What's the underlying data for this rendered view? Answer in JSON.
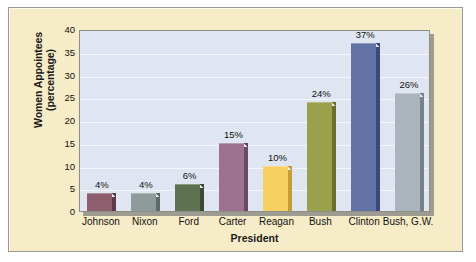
{
  "chart_data": {
    "type": "bar",
    "title": "",
    "xlabel": "President",
    "ylabel": "Women Appointees (percentage)",
    "ylabel_line1": "Women Appointees",
    "ylabel_line2": "(percentage)",
    "categories": [
      "Johnson",
      "Nixon",
      "Ford",
      "Carter",
      "Reagan",
      "Bush",
      "Clinton",
      "Bush, G.W."
    ],
    "values": [
      4,
      4,
      6,
      15,
      10,
      24,
      37,
      26
    ],
    "value_labels": [
      "4%",
      "4%",
      "6%",
      "15%",
      "10%",
      "24%",
      "37%",
      "26%"
    ],
    "ylim": [
      0,
      40
    ],
    "yticks": [
      40,
      35,
      30,
      25,
      20,
      15,
      10,
      5,
      0
    ],
    "ytick_labels": [
      "40",
      "35",
      "30",
      "25",
      "20",
      "15",
      "10",
      "5",
      "0"
    ],
    "grid": true,
    "legend": "none",
    "bar_colors": [
      "#8d5f6e",
      "#8d9b9a",
      "#5e7150",
      "#9d7190",
      "#f6d063",
      "#9aa04b",
      "#6373a8",
      "#a9b4bd"
    ],
    "bar_side_colors": [
      "#5d3c48",
      "#5e6a69",
      "#3c4a33",
      "#6a4a61",
      "#c49e34",
      "#6a6e2f",
      "#3b4878",
      "#76828c"
    ],
    "plot_bg": "#dfe6f2",
    "figure_bg": "#f7ecc8",
    "gridline_color": "#f2f5fb",
    "axis_color": "#8e8e88"
  }
}
